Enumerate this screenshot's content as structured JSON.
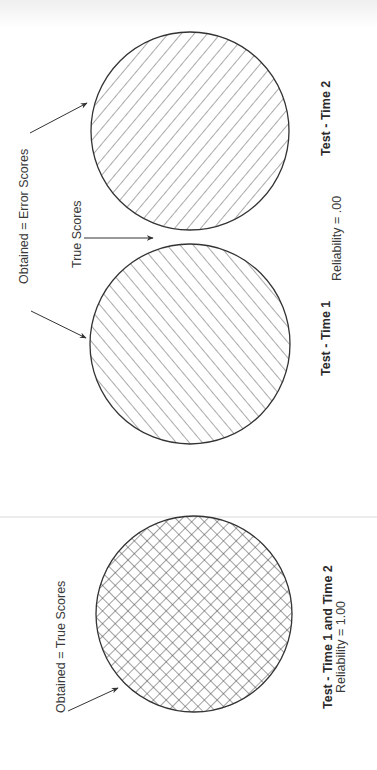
{
  "figure": {
    "orientation": "rotated -90deg (landscape page scanned in portrait)",
    "panels": [
      {
        "id": "test-time-2",
        "caption": "Test - Time 2",
        "hatch": "diagonal-backslash",
        "shared_annotations": {
          "obtained_label": "Obtained  =  Error Scores",
          "true_label": "True Scores",
          "reliability": "Reliability  =   .00"
        }
      },
      {
        "id": "test-time-1",
        "caption": "Test - Time 1",
        "hatch": "diagonal-slash"
      },
      {
        "id": "test-time-1-and-2",
        "caption": "Test - Time 1 and Time 2",
        "reliability": "Reliability  =  1.00",
        "obtained_label": "Obtained = True Scores",
        "hatch": "crosshatch"
      }
    ]
  },
  "colors": {
    "stroke": "#333333",
    "hatch": "#555555",
    "background": "#ffffff"
  }
}
